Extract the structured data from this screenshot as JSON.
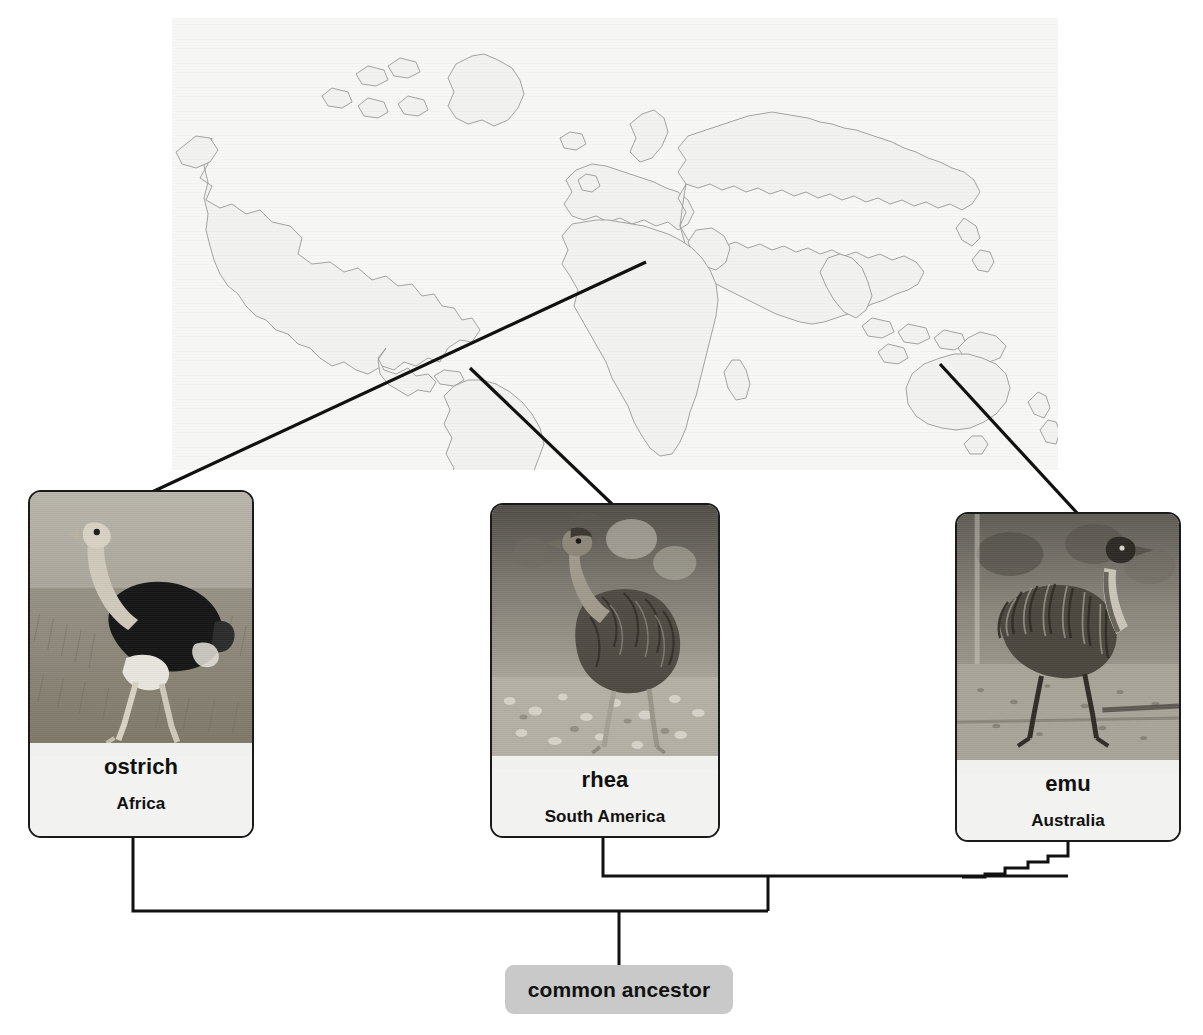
{
  "diagram": {
    "map": {
      "name": "world-map",
      "style": "outline world map, grayscale"
    },
    "species": [
      {
        "id": "ostrich",
        "name": "ostrich",
        "region": "Africa",
        "photo_alt": "ostrich standing in dry grassland"
      },
      {
        "id": "rhea",
        "name": "rhea",
        "region": "South America",
        "photo_alt": "rhea standing on stony ground"
      },
      {
        "id": "emu",
        "name": "emu",
        "region": "Australia",
        "photo_alt": "emu walking on sandy ground"
      }
    ],
    "root": {
      "label": "common ancestor"
    },
    "colors": {
      "line": "#111111",
      "card_border": "#1a1a1a",
      "card_label_bg": "#f2f2f0",
      "ancestor_bg": "#c9c9c9",
      "map_bg": "#f7f7f5",
      "map_stroke": "#9a9a98"
    }
  }
}
